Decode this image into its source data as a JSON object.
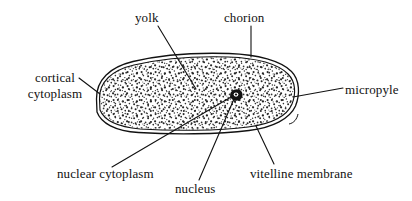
{
  "diagram": {
    "background_color": "#ffffff",
    "ink_color": "#111111",
    "labels": {
      "cortical_cytoplasm": "cortical cytoplasm",
      "cortical_cytoplasm_line1": "cortical",
      "cortical_cytoplasm_line2": "cytoplasm",
      "yolk": "yolk",
      "chorion": "chorion",
      "micropyle": "micropyle",
      "nuclear_cytoplasm": "nuclear cytoplasm",
      "nucleus": "nucleus",
      "vitelline_membrane": "vitelline membrane"
    },
    "parts": [
      {
        "name": "chorion",
        "label": "chorion",
        "description": "outer shell line of the egg"
      },
      {
        "name": "vitelline-membrane",
        "label": "vitelline membrane",
        "description": "inner membrane line just inside the chorion"
      },
      {
        "name": "cortical-cytoplasm",
        "label": "cortical cytoplasm",
        "description": "thin cytoplasm layer at the egg periphery"
      },
      {
        "name": "yolk",
        "label": "yolk",
        "description": "stippled granular interior filling the egg"
      },
      {
        "name": "nucleus",
        "label": "nucleus",
        "description": "small dark body near the centre-right of the egg"
      },
      {
        "name": "nuclear-cytoplasm",
        "label": "nuclear cytoplasm",
        "description": "cytoplasm immediately around the nucleus"
      },
      {
        "name": "micropyle",
        "label": "micropyle",
        "description": "opening at the right end of the egg"
      }
    ]
  }
}
